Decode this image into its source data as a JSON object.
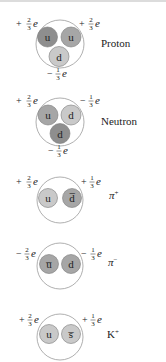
{
  "colors": {
    "hadron_outline": "#9a9a9a",
    "quark_dark": "#8e8e8e",
    "quark_medium": "#a6a6a6",
    "quark_light": "#c9c9c9",
    "quark_outline": "#7a7a7a"
  },
  "particles": [
    {
      "name": "Proton",
      "quarks": [
        "u",
        "u",
        "d"
      ],
      "charges": [
        {
          "sign": "+",
          "num": "2",
          "den": "3",
          "unit": "e"
        },
        {
          "sign": "+",
          "num": "2",
          "den": "3",
          "unit": "e"
        },
        {
          "sign": "−",
          "num": "1",
          "den": "3",
          "unit": "e"
        }
      ]
    },
    {
      "name": "Neutron",
      "quarks": [
        "u",
        "d",
        "d"
      ],
      "charges": [
        {
          "sign": "+",
          "num": "2",
          "den": "3",
          "unit": "e"
        },
        {
          "sign": "−",
          "num": "1",
          "den": "3",
          "unit": "e"
        },
        {
          "sign": "−",
          "num": "1",
          "den": "3",
          "unit": "e"
        }
      ]
    },
    {
      "name": "π",
      "name_sup": "+",
      "quarks": [
        "u",
        "d̅"
      ],
      "charges": [
        {
          "sign": "+",
          "num": "2",
          "den": "3",
          "unit": "e"
        },
        {
          "sign": "+",
          "num": "1",
          "den": "3",
          "unit": "e"
        }
      ]
    },
    {
      "name": "π",
      "name_sup": "−",
      "quarks": [
        "u̅",
        "d"
      ],
      "charges": [
        {
          "sign": "−",
          "num": "2",
          "den": "3",
          "unit": "e"
        },
        {
          "sign": "−",
          "num": "1",
          "den": "3",
          "unit": "e"
        }
      ]
    },
    {
      "name": "K",
      "name_sup": "+",
      "quarks": [
        "u",
        "s̅"
      ],
      "charges": [
        {
          "sign": "+",
          "num": "2",
          "den": "3",
          "unit": "e"
        },
        {
          "sign": "+",
          "num": "1",
          "den": "3",
          "unit": "e"
        }
      ]
    }
  ]
}
